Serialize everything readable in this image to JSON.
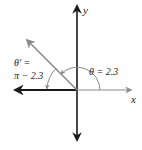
{
  "diagram": {
    "type": "reference-angle",
    "axes": {
      "x_label": "x",
      "y_label": "y"
    },
    "angle": {
      "label": "θ = 2.3",
      "value": 2.3
    },
    "reference_angle": {
      "label_line1": "θ′ =",
      "label_line2": "π − 2.3"
    },
    "colors": {
      "axis_dark": "#1a1a1a",
      "ray_gray": "#8a8a8a",
      "text": "#222222"
    }
  }
}
